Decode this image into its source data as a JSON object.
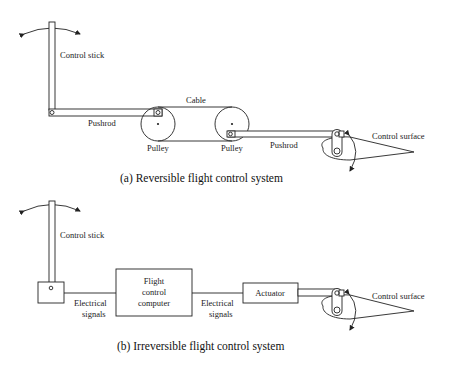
{
  "diagram_a": {
    "caption": "(a) Reversible flight control system",
    "labels": {
      "control_stick": "Control stick",
      "pushrod_left": "Pushrod",
      "cable": "Cable",
      "pulley_left": "Pulley",
      "pulley_right": "Pulley",
      "pushrod_right": "Pushrod",
      "control_surface": "Control surface"
    }
  },
  "diagram_b": {
    "caption": "(b) Irreversible flight control system",
    "labels": {
      "control_stick": "Control stick",
      "electrical_signals_1_line1": "Electrical",
      "electrical_signals_1_line2": "signals",
      "fcc_line1": "Flight",
      "fcc_line2": "control",
      "fcc_line3": "computer",
      "electrical_signals_2_line1": "Electrical",
      "electrical_signals_2_line2": "signals",
      "actuator": "Actuator",
      "control_surface": "Control surface"
    }
  },
  "colors": {
    "stroke": "#222222",
    "background": "#ffffff"
  }
}
